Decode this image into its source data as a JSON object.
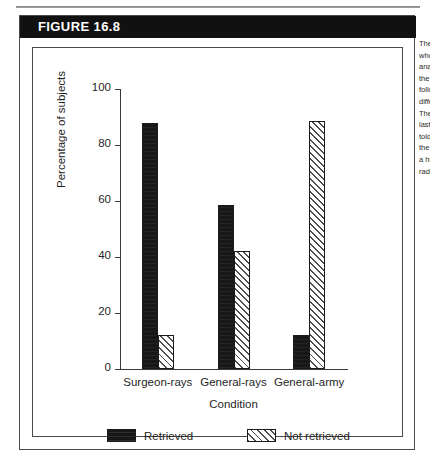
{
  "figure": {
    "banner_label": "FIGURE 16.8"
  },
  "caption": {
    "lines": [
      "The percentage of subjects",
      "who retrieved the critical",
      "analogue in each of",
      "the conditions, which",
      "followed from the",
      "different cover stories.",
      "The subjects in the",
      "last condition were",
      "told explicitly to use",
      "the earlier story as",
      "a hint in solving the",
      "radiation problem."
    ]
  },
  "chart_data": {
    "type": "bar",
    "title": "",
    "xlabel": "Condition",
    "ylabel": "Percentage of subjects",
    "categories": [
      "Surgeon-rays",
      "General-rays",
      "General-army"
    ],
    "ylim": [
      0,
      100
    ],
    "yticks": [
      0,
      20,
      40,
      60,
      80,
      100
    ],
    "ytick_labels": [
      "0",
      "20",
      "40",
      "60",
      "80",
      "100"
    ],
    "grid": false,
    "legend_position": "bottom",
    "series": [
      {
        "name": "Retrieved",
        "fill": "solid-black",
        "color": "#171717",
        "values": [
          88,
          58.5,
          12
        ]
      },
      {
        "name": "Not retrieved",
        "fill": "diagonal-hatch",
        "color": "#ffffff",
        "values": [
          12,
          42,
          88.5
        ]
      }
    ]
  }
}
